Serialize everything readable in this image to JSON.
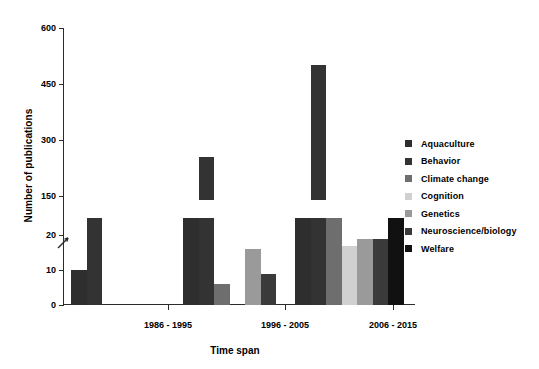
{
  "chart_data": {
    "type": "bar",
    "title": "",
    "xlabel": "Time span",
    "ylabel": "Number of publications",
    "categories": [
      "1986 - 1995",
      "1996 - 2005",
      "2006 - 2015"
    ],
    "broken_axis": true,
    "ylim_lower": [
      0,
      25
    ],
    "ylim_upper": [
      140,
      600
    ],
    "yticks_lower": [
      "0",
      "10",
      "20"
    ],
    "yticks_upper": [
      "150",
      "300",
      "450",
      "600"
    ],
    "ytick_values_lower": [
      0,
      10,
      20
    ],
    "ytick_values_upper": [
      150,
      300,
      450,
      600
    ],
    "grid": false,
    "legend_position": "right",
    "series": [
      {
        "name": "Aquaculture",
        "color": "#2e2e2e",
        "values": [
          10,
          105,
          131
        ]
      },
      {
        "name": "Behavior",
        "color": "#333333",
        "values": [
          105,
          255,
          500
        ]
      },
      {
        "name": "Climate change",
        "color": "#6e6e6e",
        "values": [
          0,
          6,
          105
        ]
      },
      {
        "name": "Cognition",
        "color": "#d0d0d0",
        "values": [
          0,
          0,
          17
        ]
      },
      {
        "name": "Genetics",
        "color": "#9a9a9a",
        "values": [
          0,
          16,
          19
        ]
      },
      {
        "name": "Neuroscience/biology",
        "color": "#3a3a3a",
        "values": [
          0,
          9,
          19
        ]
      },
      {
        "name": "Welfare",
        "color": "#111111",
        "values": [
          0,
          1,
          25
        ]
      }
    ]
  },
  "legend": {
    "items": [
      {
        "label": "Aquaculture",
        "color": "#2e2e2e"
      },
      {
        "label": "Behavior",
        "color": "#333333"
      },
      {
        "label": "Climate change",
        "color": "#6e6e6e"
      },
      {
        "label": "Cognition",
        "color": "#d0d0d0"
      },
      {
        "label": "Genetics",
        "color": "#9a9a9a"
      },
      {
        "label": "Neuroscience/biology",
        "color": "#3a3a3a"
      },
      {
        "label": "Welfare",
        "color": "#111111"
      }
    ]
  },
  "axes": {
    "y_title": "Number of publications",
    "x_title": "Time span"
  }
}
